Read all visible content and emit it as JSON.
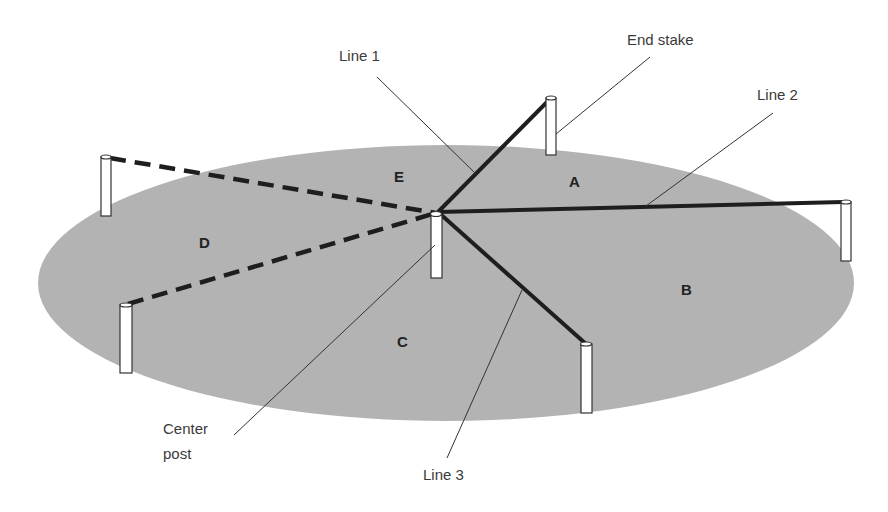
{
  "diagram": {
    "type": "plot-layout",
    "colors": {
      "ground": "#b3b3b3",
      "line": "#1e1e1e",
      "leader": "#333333",
      "stake_fill": "#ffffff",
      "stake_stroke": "#333333"
    },
    "labels": {
      "line1": "Line 1",
      "end_stake": "End stake",
      "line2": "Line 2",
      "center_post_1": "Center",
      "center_post_2": "post",
      "line3": "Line 3"
    },
    "regions": {
      "a": "A",
      "b": "B",
      "c": "C",
      "d": "D",
      "e": "E"
    }
  }
}
